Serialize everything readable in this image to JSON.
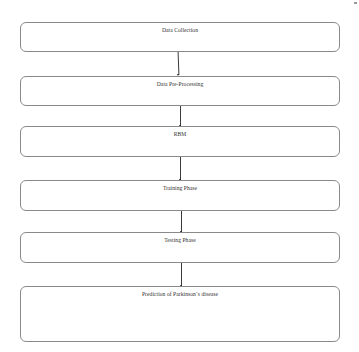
{
  "diagram": {
    "type": "flowchart",
    "direction": "top-to-bottom",
    "steps": [
      {
        "label": "Data Collection"
      },
      {
        "label": "Data Pre-Processing"
      },
      {
        "label": "RBM"
      },
      {
        "label": "Training Phase"
      },
      {
        "label": "Testing Phase"
      },
      {
        "label": "Prediction of Parkinson`s disease"
      }
    ],
    "edges": [
      {
        "from": 0,
        "to": 1
      },
      {
        "from": 1,
        "to": 2
      },
      {
        "from": 2,
        "to": 3
      },
      {
        "from": 3,
        "to": 4
      },
      {
        "from": 4,
        "to": 5
      }
    ],
    "colors": {
      "box_border": "#8a8a8a",
      "arrow": "#3a3a3a",
      "text": "#333333",
      "background": "#ffffff"
    }
  }
}
